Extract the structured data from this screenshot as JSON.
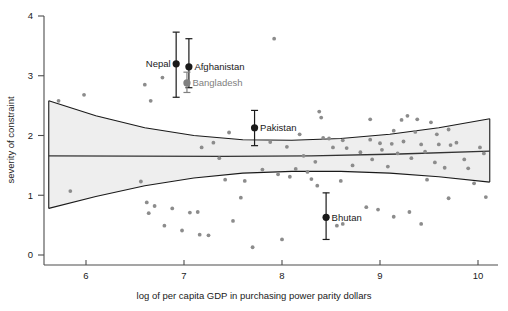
{
  "chart_data": {
    "type": "scatter",
    "title": "",
    "xlabel": "log of per capita GDP in purchasing power parity dollars",
    "ylabel": "severity of constraint",
    "xlim": [
      5.55,
      10.25
    ],
    "ylim": [
      -0.12,
      4.15
    ],
    "xticks": [
      6,
      7,
      8,
      9,
      10
    ],
    "xticklabels": [
      "6",
      "7",
      "8",
      "9",
      "10"
    ],
    "yticks": [
      0,
      1,
      2,
      3,
      4
    ],
    "yticklabels": [
      "0",
      "1",
      "2",
      "3",
      "4"
    ],
    "grid": false,
    "legend": false,
    "point_color": "#8c8c8c",
    "highlight_color": "#1a1a1a",
    "band_color": "#eeeeee",
    "highlighted": [
      {
        "name": "Nepal",
        "x": 6.92,
        "y": 3.2,
        "ylow": 2.64,
        "yhigh": 3.73,
        "label_side": "left",
        "color": "#1a1a1a"
      },
      {
        "name": "Afghanistan",
        "x": 7.05,
        "y": 3.15,
        "ylow": 2.8,
        "yhigh": 3.62,
        "label_side": "right",
        "color": "#1a1a1a"
      },
      {
        "name": "Bangladesh",
        "x": 7.03,
        "y": 2.88,
        "ylow": 2.72,
        "yhigh": 3.06,
        "label_side": "right",
        "color": "#808080"
      },
      {
        "name": "Pakistan",
        "x": 7.72,
        "y": 2.13,
        "ylow": 1.83,
        "yhigh": 2.42,
        "label_side": "right",
        "color": "#1a1a1a"
      },
      {
        "name": "Bhutan",
        "x": 8.45,
        "y": 0.63,
        "ylow": 0.26,
        "yhigh": 1.04,
        "label_side": "right",
        "color": "#1a1a1a"
      }
    ],
    "fit_line": [
      {
        "x": 5.62,
        "y": 1.66
      },
      {
        "x": 6.5,
        "y": 1.655
      },
      {
        "x": 7.4,
        "y": 1.65
      },
      {
        "x": 8.3,
        "y": 1.66
      },
      {
        "x": 9.2,
        "y": 1.69
      },
      {
        "x": 10.12,
        "y": 1.74
      }
    ],
    "ci_upper": [
      {
        "x": 5.62,
        "y": 2.58
      },
      {
        "x": 6.1,
        "y": 2.33
      },
      {
        "x": 6.6,
        "y": 2.13
      },
      {
        "x": 7.1,
        "y": 2.0
      },
      {
        "x": 7.6,
        "y": 1.93
      },
      {
        "x": 8.1,
        "y": 1.92
      },
      {
        "x": 8.6,
        "y": 1.95
      },
      {
        "x": 9.1,
        "y": 2.02
      },
      {
        "x": 9.6,
        "y": 2.13
      },
      {
        "x": 10.12,
        "y": 2.28
      }
    ],
    "ci_lower": [
      {
        "x": 5.62,
        "y": 0.78
      },
      {
        "x": 6.1,
        "y": 0.98
      },
      {
        "x": 6.6,
        "y": 1.16
      },
      {
        "x": 7.1,
        "y": 1.29
      },
      {
        "x": 7.6,
        "y": 1.37
      },
      {
        "x": 8.1,
        "y": 1.4
      },
      {
        "x": 8.6,
        "y": 1.4
      },
      {
        "x": 9.1,
        "y": 1.37
      },
      {
        "x": 9.6,
        "y": 1.31
      },
      {
        "x": 10.12,
        "y": 1.22
      }
    ],
    "points": [
      {
        "x": 5.72,
        "y": 2.58
      },
      {
        "x": 5.98,
        "y": 2.68
      },
      {
        "x": 5.84,
        "y": 1.07
      },
      {
        "x": 6.6,
        "y": 2.85
      },
      {
        "x": 6.78,
        "y": 2.97
      },
      {
        "x": 6.66,
        "y": 2.58
      },
      {
        "x": 7.92,
        "y": 3.62
      },
      {
        "x": 7.46,
        "y": 2.05
      },
      {
        "x": 7.88,
        "y": 1.89
      },
      {
        "x": 7.18,
        "y": 1.8
      },
      {
        "x": 8.05,
        "y": 1.81
      },
      {
        "x": 8.22,
        "y": 1.66
      },
      {
        "x": 6.56,
        "y": 1.23
      },
      {
        "x": 6.62,
        "y": 0.88
      },
      {
        "x": 6.7,
        "y": 0.82
      },
      {
        "x": 6.64,
        "y": 0.7
      },
      {
        "x": 6.88,
        "y": 0.78
      },
      {
        "x": 7.06,
        "y": 0.71
      },
      {
        "x": 7.14,
        "y": 0.72
      },
      {
        "x": 6.8,
        "y": 0.49
      },
      {
        "x": 6.98,
        "y": 0.41
      },
      {
        "x": 7.16,
        "y": 0.34
      },
      {
        "x": 7.25,
        "y": 0.33
      },
      {
        "x": 7.42,
        "y": 1.26
      },
      {
        "x": 7.62,
        "y": 1.24
      },
      {
        "x": 7.58,
        "y": 0.96
      },
      {
        "x": 7.5,
        "y": 0.57
      },
      {
        "x": 7.7,
        "y": 0.13
      },
      {
        "x": 8.38,
        "y": 2.4
      },
      {
        "x": 8.4,
        "y": 2.3
      },
      {
        "x": 8.9,
        "y": 2.27
      },
      {
        "x": 9.28,
        "y": 2.33
      },
      {
        "x": 9.22,
        "y": 2.26
      },
      {
        "x": 9.38,
        "y": 2.27
      },
      {
        "x": 9.52,
        "y": 2.22
      },
      {
        "x": 9.14,
        "y": 2.08
      },
      {
        "x": 9.36,
        "y": 2.06
      },
      {
        "x": 9.58,
        "y": 2.02
      },
      {
        "x": 8.42,
        "y": 1.96
      },
      {
        "x": 8.48,
        "y": 1.95
      },
      {
        "x": 8.62,
        "y": 1.92
      },
      {
        "x": 8.9,
        "y": 1.93
      },
      {
        "x": 9.0,
        "y": 1.87
      },
      {
        "x": 9.12,
        "y": 1.86
      },
      {
        "x": 9.24,
        "y": 1.9
      },
      {
        "x": 9.42,
        "y": 1.85
      },
      {
        "x": 9.6,
        "y": 1.85
      },
      {
        "x": 9.72,
        "y": 1.84
      },
      {
        "x": 9.78,
        "y": 1.88
      },
      {
        "x": 8.52,
        "y": 1.8
      },
      {
        "x": 8.66,
        "y": 1.79
      },
      {
        "x": 8.8,
        "y": 1.72
      },
      {
        "x": 9.02,
        "y": 1.76
      },
      {
        "x": 9.18,
        "y": 1.7
      },
      {
        "x": 9.46,
        "y": 1.73
      },
      {
        "x": 10.02,
        "y": 1.8
      },
      {
        "x": 10.06,
        "y": 1.7
      },
      {
        "x": 8.34,
        "y": 1.56
      },
      {
        "x": 8.92,
        "y": 1.6
      },
      {
        "x": 9.32,
        "y": 1.62
      },
      {
        "x": 9.56,
        "y": 1.55
      },
      {
        "x": 9.86,
        "y": 1.6
      },
      {
        "x": 8.72,
        "y": 1.5
      },
      {
        "x": 9.08,
        "y": 1.48
      },
      {
        "x": 9.66,
        "y": 1.46
      },
      {
        "x": 9.9,
        "y": 1.45
      },
      {
        "x": 8.14,
        "y": 1.44
      },
      {
        "x": 8.26,
        "y": 1.39
      },
      {
        "x": 7.96,
        "y": 1.35
      },
      {
        "x": 8.08,
        "y": 1.31
      },
      {
        "x": 8.3,
        "y": 1.27
      },
      {
        "x": 8.36,
        "y": 1.16
      },
      {
        "x": 8.6,
        "y": 1.24
      },
      {
        "x": 9.48,
        "y": 1.26
      },
      {
        "x": 9.96,
        "y": 1.2
      },
      {
        "x": 8.62,
        "y": 0.52
      },
      {
        "x": 8.86,
        "y": 0.8
      },
      {
        "x": 8.98,
        "y": 0.76
      },
      {
        "x": 9.14,
        "y": 0.64
      },
      {
        "x": 9.3,
        "y": 0.72
      },
      {
        "x": 9.42,
        "y": 0.52
      },
      {
        "x": 9.7,
        "y": 0.95
      },
      {
        "x": 10.08,
        "y": 0.97
      },
      {
        "x": 8.0,
        "y": 0.26
      },
      {
        "x": 8.56,
        "y": 0.49
      },
      {
        "x": 7.36,
        "y": 1.62
      },
      {
        "x": 7.3,
        "y": 1.88
      },
      {
        "x": 7.8,
        "y": 1.43
      },
      {
        "x": 8.18,
        "y": 2.02
      },
      {
        "x": 9.7,
        "y": 2.1
      }
    ]
  }
}
